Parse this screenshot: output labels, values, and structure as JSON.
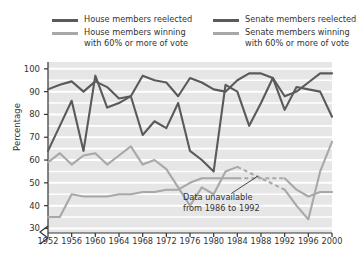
{
  "chart_data": {
    "type": "line",
    "title": "",
    "xlabel": "",
    "ylabel": "Percentage",
    "xlim": [
      1952,
      2000
    ],
    "ylim": [
      28,
      103
    ],
    "yticks": [
      30,
      40,
      50,
      60,
      70,
      80,
      90,
      100
    ],
    "xticks": [
      1952,
      1956,
      1960,
      1964,
      1968,
      1972,
      1976,
      1980,
      1984,
      1988,
      1992,
      1996,
      2000
    ],
    "grid": "horizontal-white-on-gray",
    "legend_position": "above-plot",
    "axis_break": "y-axis broken below 30",
    "annotations": [
      {
        "text_line1": "Data unavailable",
        "text_line2": "from 1986 to 1992",
        "points_to_series": "Senate members winning with 60% or more of vote",
        "style": "dashed segment 1986-1992"
      }
    ],
    "x": [
      1952,
      1954,
      1956,
      1958,
      1960,
      1962,
      1964,
      1966,
      1968,
      1970,
      1972,
      1974,
      1976,
      1978,
      1980,
      1982,
      1984,
      1986,
      1988,
      1990,
      1992,
      1994,
      1996,
      1998,
      2000
    ],
    "series": [
      {
        "name": "House members reelected",
        "color": "#5a5a5a",
        "values": [
          91,
          93,
          94.5,
          90,
          94.5,
          92,
          87,
          88,
          97,
          95,
          94,
          88,
          96,
          94,
          91,
          90,
          95,
          98,
          98,
          96,
          88,
          90,
          94,
          98,
          98
        ]
      },
      {
        "name": "House members winning with 60% or more of vote",
        "color": "#a8a8a8",
        "values": [
          35,
          35,
          45,
          44,
          44,
          44,
          45,
          45,
          46,
          46,
          47,
          47,
          50,
          52,
          52,
          52,
          52,
          null,
          null,
          null,
          52,
          47,
          44,
          46,
          46
        ]
      },
      {
        "name": "Senate members reelected",
        "color": "#5a5a5a",
        "values": [
          64,
          75,
          86,
          64,
          97,
          83,
          85,
          88,
          71,
          77,
          74,
          85,
          64,
          60,
          55,
          93,
          90,
          75,
          85,
          96,
          82,
          92,
          91,
          90,
          79
        ]
      },
      {
        "name": "Senate members winning with 60% or more of vote",
        "color": "#a8a8a8",
        "values": [
          59,
          63,
          58,
          62,
          63,
          58,
          62,
          66,
          58,
          60,
          56,
          48,
          40,
          48,
          45,
          55,
          57,
          null,
          null,
          null,
          47,
          40,
          34,
          55,
          68
        ]
      }
    ]
  },
  "legend": {
    "entries": [
      {
        "label_line1": "House members reelected",
        "label_line2": "",
        "color": "#5a5a5a"
      },
      {
        "label_line1": "House members winning",
        "label_line2": "with 60% or more of vote",
        "color": "#a8a8a8"
      },
      {
        "label_line1": "Senate members reelected",
        "label_line2": "",
        "color": "#5a5a5a"
      },
      {
        "label_line1": "Senate members winning",
        "label_line2": "with 60% or more of vote",
        "color": "#a8a8a8"
      }
    ]
  },
  "axes": {
    "ylabel": "Percentage",
    "yticks": [
      "100",
      "90",
      "80",
      "70",
      "60",
      "50",
      "40",
      "30"
    ],
    "xticks": [
      "1952",
      "1956",
      "1960",
      "1964",
      "1968",
      "1972",
      "1976",
      "1980",
      "1984",
      "1988",
      "1992",
      "1996",
      "2000"
    ]
  },
  "annotation": {
    "line1": "Data unavailable",
    "line2": "from 1986 to 1992"
  },
  "colors": {
    "dark_series": "#5a5a5a",
    "light_series": "#a8a8a8",
    "plot_background": "#e6e6e6",
    "gridline": "#ffffff",
    "axis": "#333333",
    "text": "#333333"
  }
}
